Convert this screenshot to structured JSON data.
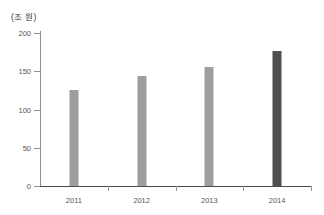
{
  "chart_data": {
    "type": "bar",
    "title": "",
    "subtitle": "",
    "unit_label": "(조 원)",
    "xlabel": "",
    "ylabel": "",
    "categories": [
      "2011",
      "2012",
      "2013",
      "2014"
    ],
    "values": [
      125,
      144,
      155,
      176
    ],
    "series": [
      {
        "name": "",
        "values": [
          125,
          144,
          155,
          176
        ]
      }
    ],
    "bar_colors": [
      "#9e9e9e",
      "#9e9e9e",
      "#9e9e9e",
      "#4f4f4f"
    ],
    "ylim": [
      0,
      200
    ],
    "ytick_labels": [
      "0",
      "50",
      "100",
      "150",
      "200"
    ],
    "ytick_values": [
      0,
      50,
      100,
      150,
      200
    ],
    "grid": false,
    "legend": null,
    "annotations": []
  },
  "axes": {
    "y_axis_color": "#8e8e8e",
    "x_axis_color": "#4a4a4a",
    "tick_label_color": "#555555"
  }
}
